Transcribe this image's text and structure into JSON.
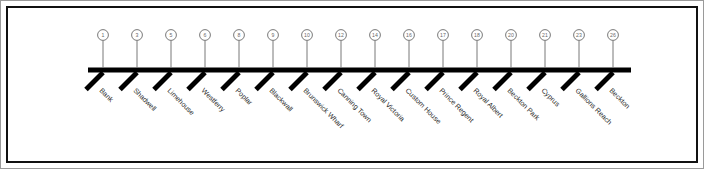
{
  "figure": {
    "type": "rail-line-diagram",
    "title": "",
    "frame_color": "#111111",
    "rail_color": "#000000",
    "marker_stroke_color": "#6a6a6a",
    "label_color": "#2b2b2b",
    "label_rotation_degrees": 45,
    "station_count": 16,
    "stations": [
      {
        "number": "1",
        "name": "Bank",
        "x": 103
      },
      {
        "number": "3",
        "name": "Shadwell",
        "x": 137
      },
      {
        "number": "5",
        "name": "Limehouse",
        "x": 171
      },
      {
        "number": "6",
        "name": "Westferry",
        "x": 205
      },
      {
        "number": "8",
        "name": "Poplar",
        "x": 239
      },
      {
        "number": "9",
        "name": "Blackwall",
        "x": 273
      },
      {
        "number": "10",
        "name": "Brunswick Wharf",
        "x": 307
      },
      {
        "number": "12",
        "name": "Canning Town",
        "x": 341
      },
      {
        "number": "14",
        "name": "Royal Victoria",
        "x": 375
      },
      {
        "number": "16",
        "name": "Custom House",
        "x": 409
      },
      {
        "number": "17",
        "name": "Prince Regent",
        "x": 443
      },
      {
        "number": "18",
        "name": "Royal Albert",
        "x": 477
      },
      {
        "number": "20",
        "name": "Beckton Park",
        "x": 511
      },
      {
        "number": "21",
        "name": "Cyprus",
        "x": 545
      },
      {
        "number": "23",
        "name": "Gallions Reach",
        "x": 579
      },
      {
        "number": "26",
        "name": "Beckton",
        "x": 613
      }
    ],
    "geometry": {
      "rail_y": 70,
      "rail_left": 88,
      "rail_right": 631,
      "rail_thickness": 5,
      "tick_drop": 17,
      "tick_run": 17,
      "tick_thickness": 5,
      "marker_y": 35,
      "marker_radius": 5.4,
      "stem_top": 40.4,
      "label_offset_x": -4,
      "label_offset_y": 21
    }
  }
}
